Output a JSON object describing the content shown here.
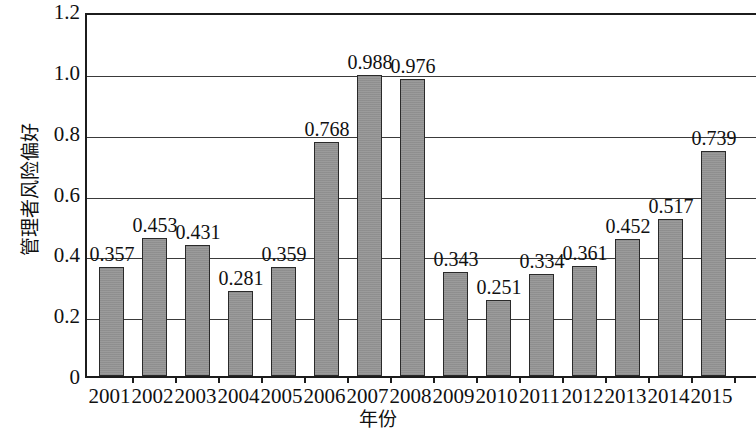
{
  "chart_data": {
    "type": "bar",
    "title": "",
    "xlabel": "年份",
    "ylabel": "管理者风险偏好",
    "ylim": [
      0,
      1.2
    ],
    "ytick_labels": [
      "0",
      "0.2",
      "0.4",
      "0.6",
      "0.8",
      "1.0",
      "1.2"
    ],
    "ytick_values": [
      0,
      0.2,
      0.4,
      0.6,
      0.8,
      1.0,
      1.2
    ],
    "grid": "horizontal",
    "legend": "none",
    "bar_color": "#969696",
    "bar_edge_color": "#2a2a2a",
    "axis_color": "#1c1c1c",
    "categories": [
      "2001",
      "2002",
      "2003",
      "2004",
      "2005",
      "2006",
      "2007",
      "2008",
      "2009",
      "2010",
      "2011",
      "2012",
      "2013",
      "2014",
      "2015"
    ],
    "values": [
      0.357,
      0.453,
      0.431,
      0.281,
      0.359,
      0.768,
      0.988,
      0.976,
      0.343,
      0.251,
      0.334,
      0.361,
      0.452,
      0.517,
      0.739
    ],
    "data_labels": [
      "0.357",
      "0.453",
      "0.431",
      "0.281",
      "0.359",
      "0.768",
      "0.988",
      "0.976",
      "0.343",
      "0.251",
      "0.334",
      "0.361",
      "0.452",
      "0.517",
      "0.739"
    ]
  }
}
